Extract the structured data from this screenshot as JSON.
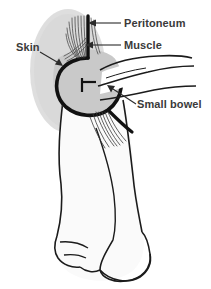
{
  "figure": {
    "background_color": "#ffffff",
    "ink_color": "#1b1b1b",
    "label_color": "#3a3a3a",
    "skin_fill_color": "#dcdcdc",
    "body_fill_color": "#fafafa",
    "cavity_fill_color": "#c9c9c9"
  },
  "labels": {
    "peritoneum": "Peritoneum",
    "muscle": "Muscle",
    "skin": "Skin",
    "small_bowel": "Small bowel"
  },
  "annotations": [
    {
      "id": "peritoneum",
      "text": "Peritoneum",
      "text_x": 124,
      "text_y": 27,
      "anchor": "start"
    },
    {
      "id": "muscle",
      "text": "Muscle",
      "text_x": 124,
      "text_y": 49,
      "anchor": "start"
    },
    {
      "id": "skin",
      "text": "Skin",
      "text_x": 16,
      "text_y": 51,
      "anchor": "start"
    },
    {
      "id": "small_bowel",
      "text": "Small bowel",
      "text_x": 137,
      "text_y": 108,
      "anchor": "start"
    }
  ],
  "structures": [
    {
      "id": "skin-layer",
      "name": "Skin"
    },
    {
      "id": "muscle-layer",
      "name": "Muscle"
    },
    {
      "id": "peritoneum-layer",
      "name": "Peritoneum"
    },
    {
      "id": "small-bowel",
      "name": "Small bowel"
    },
    {
      "id": "body-outline",
      "name": "Penis and scrotum outline"
    }
  ]
}
